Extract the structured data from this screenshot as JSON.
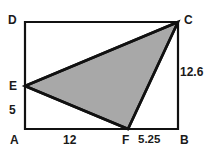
{
  "figure": {
    "kind": "geometry-diagram",
    "background_color": "#ffffff",
    "stroke_color": "#111111",
    "fill_color": "#a8a8a8",
    "rectangle_stroke_width": 2.2,
    "triangle_stroke_width": 2.6,
    "vertices": {
      "A": {
        "label": "A",
        "x": 25,
        "y": 129
      },
      "B": {
        "label": "B",
        "x": 178,
        "y": 129
      },
      "C": {
        "label": "C",
        "x": 178,
        "y": 22
      },
      "D": {
        "label": "D",
        "x": 25,
        "y": 22
      },
      "E": {
        "label": "E",
        "x": 25,
        "y": 86
      },
      "F": {
        "label": "F",
        "x": 128,
        "y": 129
      }
    },
    "shaded_polygon": {
      "name": "triangle-CEF",
      "points": "178,22 25,86 128,129"
    },
    "measurements": [
      {
        "name": "AE",
        "label": "5",
        "side": "left"
      },
      {
        "name": "BC",
        "label": "12.6",
        "side": "right"
      },
      {
        "name": "AF",
        "label": "12",
        "side": "bottom"
      },
      {
        "name": "FB",
        "label": "5.25",
        "side": "bottom"
      }
    ]
  },
  "labels": {
    "D": "D",
    "C": "C",
    "E": "E",
    "A": "A",
    "B": "B",
    "F": "F",
    "AE": "5",
    "BC": "12.6",
    "AF": "12",
    "FB": "5.25"
  }
}
